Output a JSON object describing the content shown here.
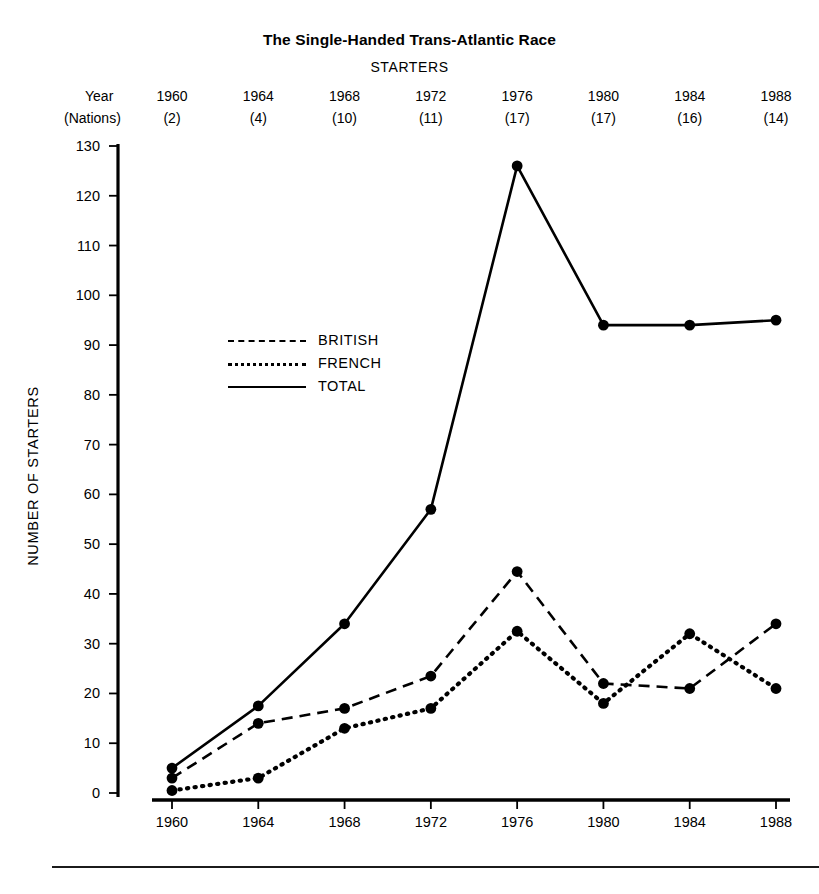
{
  "chart_data": {
    "type": "line",
    "title": "The Single-Handed Trans-Atlantic Race",
    "subtitle": "STARTERS",
    "xlabel": "",
    "ylabel": "NUMBER OF STARTERS",
    "x": [
      1960,
      1964,
      1968,
      1972,
      1976,
      1980,
      1984,
      1988
    ],
    "categories": [
      "1960",
      "1964",
      "1968",
      "1972",
      "1976",
      "1980",
      "1984",
      "1988"
    ],
    "xtick_labels": [
      "1960",
      "1964",
      "1968",
      "1972",
      "1976",
      "1980",
      "1984",
      "1988"
    ],
    "ytick_labels": [
      "0",
      "10",
      "20",
      "30",
      "40",
      "50",
      "60",
      "70",
      "80",
      "90",
      "100",
      "110",
      "120",
      "130"
    ],
    "yticks": [
      0,
      10,
      20,
      30,
      40,
      50,
      60,
      70,
      80,
      90,
      100,
      110,
      120,
      130
    ],
    "ylim": [
      0,
      130
    ],
    "grid": false,
    "legend_position": "upper-left-inside",
    "series": [
      {
        "name": "BRITISH",
        "style": "dashed",
        "color": "#000000",
        "values": [
          3,
          14,
          17,
          23.5,
          44.5,
          22,
          21,
          34
        ]
      },
      {
        "name": "FRENCH",
        "style": "dotted",
        "color": "#000000",
        "values": [
          0.5,
          3,
          13,
          17,
          32.5,
          18,
          32,
          21
        ]
      },
      {
        "name": "TOTAL",
        "style": "solid",
        "color": "#000000",
        "values": [
          5,
          17.5,
          34,
          57,
          126,
          94,
          94,
          95
        ]
      }
    ],
    "header_table": {
      "row_labels": [
        "Year",
        "(Nations)"
      ],
      "years": [
        "1960",
        "1964",
        "1968",
        "1972",
        "1976",
        "1980",
        "1984",
        "1988"
      ],
      "nations": [
        "(2)",
        "(4)",
        "(10)",
        "(11)",
        "(17)",
        "(17)",
        "(16)",
        "(14)"
      ]
    }
  }
}
